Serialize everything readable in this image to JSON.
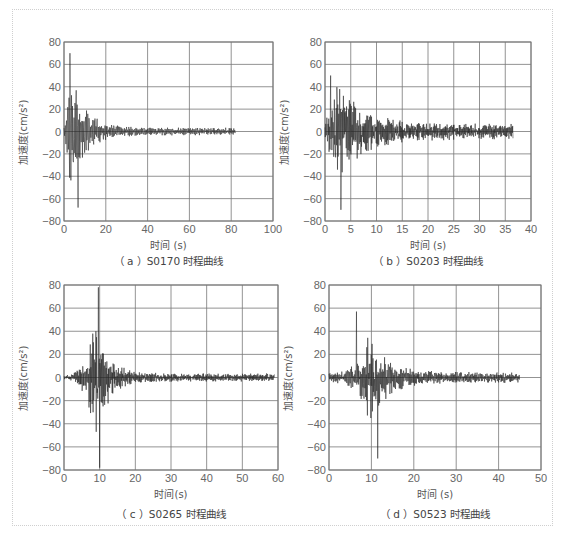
{
  "figure": {
    "frame_color": "#cfcfcf",
    "grid_color": "#777777",
    "line_color": "#222222"
  },
  "panels": [
    {
      "id": "a",
      "caption": "（ a ）S0170 时程曲线",
      "xlabel": "时间 (s)",
      "ylabel": "加速度(cm/s²)",
      "xticks": [
        "0",
        "20",
        "40",
        "60",
        "80",
        "100"
      ],
      "yticks": [
        "80",
        "60",
        "40",
        "20",
        "0",
        "−20",
        "−40",
        "−60",
        "−80"
      ]
    },
    {
      "id": "b",
      "caption": "（ b ）S0203 时程曲线",
      "xlabel": "时间 (s)",
      "ylabel": "加速度(cm/s²)",
      "xticks": [
        "0",
        "5",
        "10",
        "15",
        "20",
        "25",
        "30",
        "35",
        "40"
      ],
      "yticks": [
        "80",
        "60",
        "40",
        "20",
        "0",
        "−20",
        "−40",
        "−60",
        "−80"
      ]
    },
    {
      "id": "c",
      "caption": "（ c ）S0265 时程曲线",
      "xlabel": "时间(s)",
      "ylabel": "加速度(cm/s²)",
      "xticks": [
        "0",
        "10",
        "20",
        "30",
        "40",
        "50",
        "60"
      ],
      "yticks": [
        "80",
        "60",
        "40",
        "20",
        "0",
        "−20",
        "−40",
        "−60",
        "−80"
      ]
    },
    {
      "id": "d",
      "caption": "（ d ）S0523 时程曲线",
      "xlabel": "时间 (s)",
      "ylabel": "加速度(cm/s²)",
      "xticks": [
        "0",
        "10",
        "20",
        "30",
        "40",
        "50"
      ],
      "yticks": [
        "80",
        "60",
        "40",
        "20",
        "0",
        "−20",
        "−40",
        "−60",
        "−80"
      ]
    }
  ],
  "chart_data": [
    {
      "type": "line",
      "title": "(a) S0170 时程曲线",
      "xlabel": "时间 (s)",
      "ylabel": "加速度(cm/s²)",
      "xlim": [
        0,
        100
      ],
      "ylim": [
        -80,
        80
      ],
      "xticks": [
        0,
        20,
        40,
        60,
        80,
        100
      ],
      "yticks": [
        -80,
        -60,
        -40,
        -20,
        0,
        20,
        40,
        60,
        80
      ],
      "grid": true,
      "duration": 82,
      "peaks": {
        "max": {
          "t": 2.8,
          "a": 70
        },
        "min": {
          "t": 6.8,
          "a": -68
        }
      },
      "envelope": {
        "t_peak": 3,
        "amp": 45,
        "rise": 1.5,
        "decay": 7,
        "floor": 3,
        "freq": 1.6
      },
      "seed": 17
    },
    {
      "type": "line",
      "title": "(b) S0203 时程曲线",
      "xlabel": "时间 (s)",
      "ylabel": "加速度(cm/s²)",
      "xlim": [
        0,
        40
      ],
      "ylim": [
        -80,
        80
      ],
      "xticks": [
        0,
        5,
        10,
        15,
        20,
        25,
        30,
        35,
        40
      ],
      "yticks": [
        -80,
        -60,
        -40,
        -20,
        0,
        20,
        40,
        60,
        80
      ],
      "grid": true,
      "duration": 36.5,
      "peaks": {
        "max": {
          "t": 1.1,
          "a": 50
        },
        "min": {
          "t": 3.1,
          "a": -70
        }
      },
      "envelope": {
        "t_peak": 2.5,
        "amp": 38,
        "rise": 0.8,
        "decay": 5,
        "floor": 6,
        "freq": 2.2
      },
      "seed": 23
    },
    {
      "type": "line",
      "title": "(c) S0265 时程曲线",
      "xlabel": "时间(s)",
      "ylabel": "加速度(cm/s²)",
      "xlim": [
        0,
        60
      ],
      "ylim": [
        -80,
        80
      ],
      "xticks": [
        0,
        10,
        20,
        30,
        40,
        50,
        60
      ],
      "yticks": [
        -80,
        -60,
        -40,
        -20,
        0,
        20,
        40,
        60,
        80
      ],
      "grid": true,
      "duration": 59,
      "peaks": {
        "max": {
          "t": 9.6,
          "a": 78
        },
        "min": {
          "t": 10.0,
          "a": -78
        }
      },
      "envelope": {
        "t_peak": 9,
        "amp": 45,
        "rise": 3,
        "decay": 3.5,
        "floor": 3,
        "freq": 2.2
      },
      "seed": 31
    },
    {
      "type": "line",
      "title": "(d) S0523 时程曲线",
      "xlabel": "时间 (s)",
      "ylabel": "加速度(cm/s²)",
      "xlim": [
        0,
        50
      ],
      "ylim": [
        -80,
        80
      ],
      "xticks": [
        0,
        10,
        20,
        30,
        40,
        50
      ],
      "yticks": [
        -80,
        -60,
        -40,
        -20,
        0,
        20,
        40,
        60,
        80
      ],
      "grid": true,
      "duration": 45,
      "peaks": {
        "max": {
          "t": 6.5,
          "a": 57
        },
        "min": {
          "t": 11.5,
          "a": -70
        }
      },
      "envelope": {
        "t_peak": 9.5,
        "amp": 35,
        "rise": 3.5,
        "decay": 4,
        "floor": 4,
        "freq": 2.0
      },
      "seed": 47
    }
  ]
}
